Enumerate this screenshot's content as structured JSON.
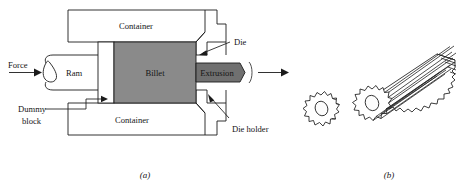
{
  "figure": {
    "captions": {
      "left": "(a)",
      "right": "(b)"
    },
    "colors": {
      "billet_fill": "#8a8a8a",
      "extrusion_fill": "#707070",
      "outline": "#1b1b1b",
      "background": "#ffffff",
      "text": "#151515"
    },
    "panel_a": {
      "name": "direct-extrusion-schematic",
      "labels": {
        "force": "Force",
        "ram": "Ram",
        "dummy_block": "Dummy\nblock",
        "dummy_block_line1": "Dummy",
        "dummy_block_line2": "block",
        "container_top": "Container",
        "container_bottom": "Container",
        "billet": "Billet",
        "extrusion": "Extrusion",
        "die": "Die",
        "die_holder": "Die holder"
      },
      "arrows": {
        "force_direction": "right",
        "extrusion_exit_direction": "right"
      }
    },
    "panel_b": {
      "name": "extruded-gear-product",
      "items": [
        {
          "label": "",
          "shape": "gear-cross-section",
          "teeth": 14
        },
        {
          "label": "",
          "shape": "gear-extrusion-bar",
          "teeth": 14
        }
      ]
    }
  }
}
